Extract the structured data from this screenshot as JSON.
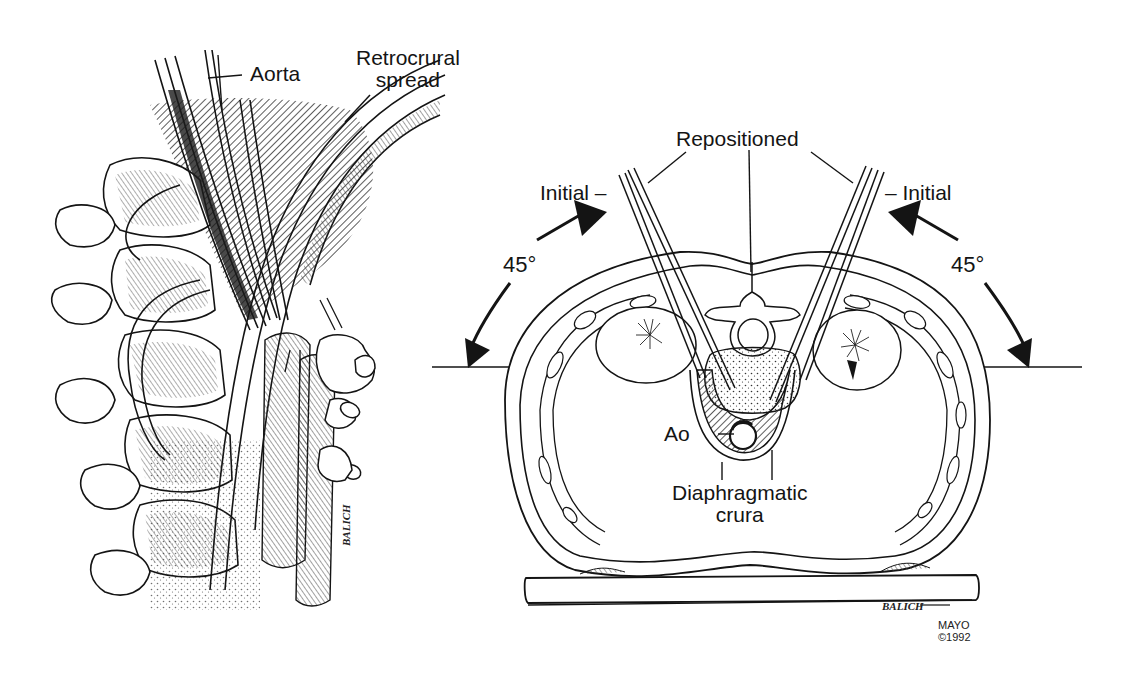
{
  "figure": {
    "colors": {
      "ink": "#141414",
      "background": "#ffffff",
      "hatch": "#333333"
    }
  },
  "left_panel": {
    "name": "Lateral view of spine with retrocrural spread",
    "labels": {
      "aorta": "Aorta",
      "retrocrural_line1": "Retrocrural",
      "retrocrural_line2": "spread"
    },
    "artist_signature": "BALICH"
  },
  "right_panel": {
    "name": "Axial cross-section with needle positions",
    "labels": {
      "repositioned": "Repositioned",
      "initial_left": "Initial –",
      "initial_right": "– Initial",
      "angle_left": "45°",
      "angle_right": "45°",
      "ao": "Ao",
      "crura_line1": "Diaphragmatic",
      "crura_line2": "crura"
    },
    "artist_signature": "BALICH",
    "credit_line1": "MAYO",
    "credit_line2": "©1992"
  }
}
